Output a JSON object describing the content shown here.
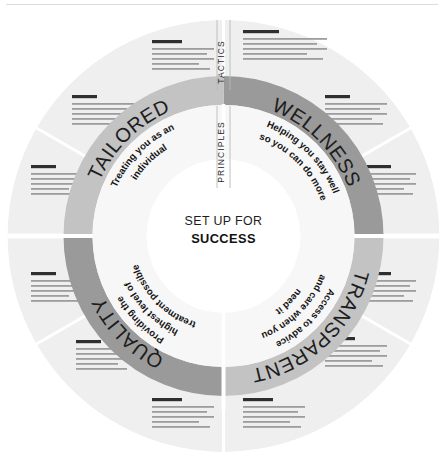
{
  "diagram": {
    "title_center_line1": "SET UP FOR",
    "title_center_line2": "SUCCESS",
    "axis_outer_label": "TACTICS",
    "axis_inner_label": "PRINCIPLES",
    "colors": {
      "ring_dark": "#9a9a9a",
      "ring_light": "#c3c3c3",
      "outer_sector": "#efefef",
      "outer_sector_alt": "#ececec",
      "divider": "#ffffff",
      "text_dark": "#1d1d1d",
      "placeholder_heading": "#2f2f2f",
      "placeholder_line": "#9d9d9d",
      "header_rule": "#dcdcdc",
      "page_background": "#ffffff"
    },
    "quadrants": [
      {
        "id": "wellness",
        "name": "WELLNESS",
        "tone": "dark",
        "description_lines": [
          "Helping you stay well",
          "so you can do more"
        ]
      },
      {
        "id": "transparent",
        "name": "TRANSPARENT",
        "tone": "light",
        "description_lines": [
          "Access to advice",
          "and care when you",
          "need it"
        ]
      },
      {
        "id": "quality",
        "name": "QUALITY",
        "tone": "dark",
        "description_lines": [
          "Providing the",
          "highest level of",
          "treatment possible"
        ]
      },
      {
        "id": "tailored",
        "name": "TAILORED",
        "tone": "light",
        "description_lines": [
          "Treating you as an",
          "individual"
        ]
      }
    ],
    "outer_sectors": [
      {
        "id": "sector-1",
        "quadrant": "wellness",
        "placeholder_lines": 5
      },
      {
        "id": "sector-2",
        "quadrant": "wellness",
        "placeholder_lines": 5
      },
      {
        "id": "sector-3",
        "quadrant": "wellness",
        "placeholder_lines": 5
      },
      {
        "id": "sector-4",
        "quadrant": "transparent",
        "placeholder_lines": 5
      },
      {
        "id": "sector-5",
        "quadrant": "transparent",
        "placeholder_lines": 5
      },
      {
        "id": "sector-6",
        "quadrant": "transparent",
        "placeholder_lines": 5
      },
      {
        "id": "sector-7",
        "quadrant": "quality",
        "placeholder_lines": 5
      },
      {
        "id": "sector-8",
        "quadrant": "quality",
        "placeholder_lines": 5
      },
      {
        "id": "sector-9",
        "quadrant": "quality",
        "placeholder_lines": 5
      },
      {
        "id": "sector-10",
        "quadrant": "tailored",
        "placeholder_lines": 5
      },
      {
        "id": "sector-11",
        "quadrant": "tailored",
        "placeholder_lines": 5
      },
      {
        "id": "sector-12",
        "quadrant": "tailored",
        "placeholder_lines": 5
      }
    ]
  }
}
